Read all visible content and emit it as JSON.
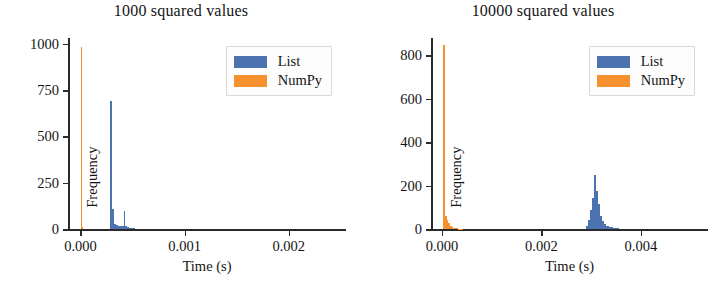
{
  "figure": {
    "background": "#ffffff",
    "colors": {
      "list": "#4c72b0",
      "numpy": "#f5922f",
      "axis": "#2a2a2a",
      "text": "#141414"
    }
  },
  "chart_data": [
    {
      "type": "bar",
      "subtype": "histogram",
      "title": "1000 squared values",
      "xlabel": "Time (s)",
      "ylabel": "Frequency",
      "xlim": [
        -0.00012,
        0.00255
      ],
      "ylim": [
        0,
        1030
      ],
      "xticks": [
        0.0,
        0.001,
        0.002
      ],
      "xticklabels": [
        "0.000",
        "0.001",
        "0.002"
      ],
      "yticks": [
        0,
        250,
        500,
        750,
        1000
      ],
      "yticklabels": [
        "0",
        "250",
        "500",
        "750",
        "1000"
      ],
      "grid": false,
      "legend": {
        "position": "upper right",
        "entries": [
          "List",
          "NumPy"
        ]
      },
      "series": [
        {
          "name": "NumPy",
          "color": "#f5922f",
          "bins": [
            {
              "x0": 5e-06,
              "x1": 1.3e-05,
              "count": 980
            },
            {
              "x0": 1.3e-05,
              "x1": 2.1e-05,
              "count": 12
            }
          ]
        },
        {
          "name": "List",
          "color": "#4c72b0",
          "bins": [
            {
              "x0": 0.000288,
              "x1": 0.000306,
              "count": 690
            },
            {
              "x0": 0.000306,
              "x1": 0.000324,
              "count": 112
            },
            {
              "x0": 0.000324,
              "x1": 0.000342,
              "count": 30
            },
            {
              "x0": 0.000342,
              "x1": 0.00036,
              "count": 22
            },
            {
              "x0": 0.00036,
              "x1": 0.000378,
              "count": 20
            },
            {
              "x0": 0.000378,
              "x1": 0.000396,
              "count": 18
            },
            {
              "x0": 0.000396,
              "x1": 0.000414,
              "count": 18
            },
            {
              "x0": 0.000414,
              "x1": 0.000432,
              "count": 100
            },
            {
              "x0": 0.000432,
              "x1": 0.00045,
              "count": 16
            },
            {
              "x0": 0.00045,
              "x1": 0.000468,
              "count": 12
            },
            {
              "x0": 0.000468,
              "x1": 0.00052,
              "count": 6
            }
          ]
        }
      ]
    },
    {
      "type": "bar",
      "subtype": "histogram",
      "title": "10000 squared values",
      "xlabel": "Time (s)",
      "ylabel": "Frequency",
      "xlim": [
        -0.00022,
        0.00535
      ],
      "ylim": [
        0,
        880
      ],
      "xticks": [
        0.0,
        0.002,
        0.004
      ],
      "xticklabels": [
        "0.000",
        "0.002",
        "0.004"
      ],
      "yticks": [
        0,
        200,
        400,
        600,
        800
      ],
      "yticklabels": [
        "0",
        "200",
        "400",
        "600",
        "800"
      ],
      "grid": false,
      "legend": {
        "position": "upper right",
        "entries": [
          "List",
          "NumPy"
        ]
      },
      "series": [
        {
          "name": "NumPy",
          "color": "#f5922f",
          "bins": [
            {
              "x0": 2.6e-05,
              "x1": 6e-05,
              "count": 848
            },
            {
              "x0": 6e-05,
              "x1": 9.4e-05,
              "count": 60
            },
            {
              "x0": 9.4e-05,
              "x1": 0.000128,
              "count": 42
            },
            {
              "x0": 0.000128,
              "x1": 0.000162,
              "count": 28
            },
            {
              "x0": 0.000162,
              "x1": 0.000196,
              "count": 18
            },
            {
              "x0": 0.000196,
              "x1": 0.00023,
              "count": 12
            },
            {
              "x0": 0.00023,
              "x1": 0.000264,
              "count": 8
            },
            {
              "x0": 0.000264,
              "x1": 0.00032,
              "count": 5
            },
            {
              "x0": 0.00032,
              "x1": 0.00042,
              "count": 3
            }
          ]
        },
        {
          "name": "List",
          "color": "#4c72b0",
          "bins": [
            {
              "x0": 0.0029,
              "x1": 0.00294,
              "count": 18
            },
            {
              "x0": 0.00294,
              "x1": 0.00298,
              "count": 42
            },
            {
              "x0": 0.00298,
              "x1": 0.00302,
              "count": 88
            },
            {
              "x0": 0.00302,
              "x1": 0.00306,
              "count": 145
            },
            {
              "x0": 0.00306,
              "x1": 0.0031,
              "count": 250
            },
            {
              "x0": 0.0031,
              "x1": 0.00314,
              "count": 178
            },
            {
              "x0": 0.00314,
              "x1": 0.00318,
              "count": 118
            },
            {
              "x0": 0.00318,
              "x1": 0.00322,
              "count": 62
            },
            {
              "x0": 0.00322,
              "x1": 0.00326,
              "count": 38
            },
            {
              "x0": 0.00326,
              "x1": 0.0033,
              "count": 26
            },
            {
              "x0": 0.0033,
              "x1": 0.00336,
              "count": 18
            },
            {
              "x0": 0.00336,
              "x1": 0.00344,
              "count": 10
            },
            {
              "x0": 0.00344,
              "x1": 0.00356,
              "count": 6
            }
          ]
        }
      ]
    }
  ]
}
